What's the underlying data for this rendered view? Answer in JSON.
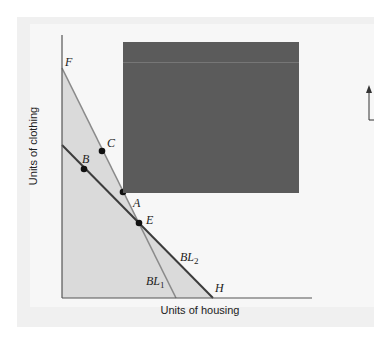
{
  "figure": {
    "y_axis_label": "Units of clothing",
    "x_axis_label": "Units of housing",
    "points": [
      {
        "label": "F",
        "x": 62,
        "y": 68
      },
      {
        "label": "C",
        "x": 102,
        "y": 151
      },
      {
        "label": "B",
        "x": 84,
        "y": 169
      },
      {
        "label": "A",
        "x": 123,
        "y": 192
      },
      {
        "label": "E",
        "x": 139,
        "y": 223
      },
      {
        "label": "H",
        "x": 213,
        "y": 298
      }
    ],
    "lines": [
      {
        "label": "BL1",
        "sub": "1",
        "from": [
          62,
          68
        ],
        "to": [
          176,
          298
        ],
        "color": "#8a8a8a"
      },
      {
        "label": "BL2",
        "sub": "2",
        "from": [
          62,
          145
        ],
        "to": [
          213,
          298
        ],
        "color": "#3c3c3c"
      }
    ],
    "colors": {
      "shade": "#dadada",
      "overlay": "#5b5b5b",
      "axis": "#555555"
    }
  },
  "labels": {
    "F": "F",
    "C": "C",
    "B": "B",
    "A": "A",
    "E": "E",
    "H": "H",
    "BL": "BL",
    "sub1": "1",
    "sub2": "2"
  }
}
